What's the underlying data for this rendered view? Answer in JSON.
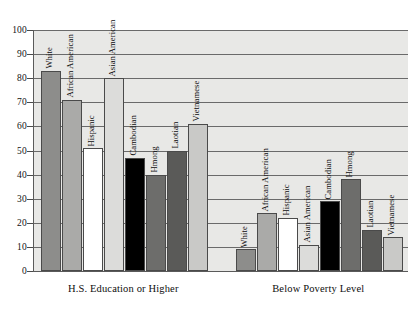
{
  "chart_data": {
    "type": "bar",
    "title": "",
    "subtitle": "",
    "xlabel": "",
    "ylabel": "",
    "ylim": [
      0,
      100
    ],
    "yticks": [
      0,
      10,
      20,
      30,
      40,
      50,
      60,
      70,
      80,
      90,
      100
    ],
    "grid": true,
    "legend": "none",
    "bar_labels_inside": true,
    "groups": [
      {
        "name": "H.S. Education or Higher",
        "categories": [
          "White",
          "African American",
          "Hispanic",
          "Asian American",
          "Cambodian",
          "Hmong",
          "Laotian",
          "Vietnamese"
        ],
        "values": [
          83,
          71,
          51,
          80,
          47,
          40,
          50,
          61
        ],
        "colors": [
          "#8d8d8b",
          "#aaaaa8",
          "#ffffff",
          "#dcdcda",
          "#000000",
          "#6d6d6b",
          "#5a5a58",
          "#c9c9c7"
        ]
      },
      {
        "name": "Below Poverty Level",
        "categories": [
          "White",
          "African American",
          "Hispanic",
          "Asian American",
          "Cambodian",
          "Hmong",
          "Laotian",
          "Vietnamese"
        ],
        "values": [
          9,
          24,
          22,
          11,
          29,
          38,
          17,
          14
        ],
        "colors": [
          "#8d8d8b",
          "#aaaaa8",
          "#ffffff",
          "#dcdcda",
          "#000000",
          "#6d6d6b",
          "#5a5a58",
          "#c9c9c7"
        ]
      }
    ]
  },
  "axis": {
    "y_tick_labels": [
      "0",
      "10",
      "20",
      "30",
      "40",
      "50",
      "60",
      "70",
      "80",
      "90",
      "100"
    ]
  },
  "group_labels": {
    "group0": "H.S. Education or Higher",
    "group1": "Below Poverty Level"
  }
}
